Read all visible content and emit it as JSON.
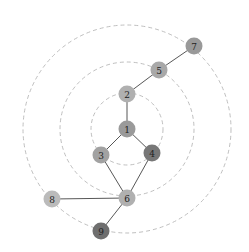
{
  "diagram": {
    "type": "radial-graph",
    "center": {
      "x": 127,
      "y": 129
    },
    "rings": [
      {
        "r": 36
      },
      {
        "r": 67
      },
      {
        "r": 104
      }
    ],
    "node_radius": 8.5,
    "nodes": [
      {
        "id": "1",
        "label": "1",
        "x": 127,
        "y": 129,
        "color": "#9a9a9a"
      },
      {
        "id": "2",
        "label": "2",
        "x": 127,
        "y": 94,
        "color": "#b0b0b0"
      },
      {
        "id": "3",
        "label": "3",
        "x": 101,
        "y": 155,
        "color": "#a2a2a2"
      },
      {
        "id": "4",
        "label": "4",
        "x": 152,
        "y": 153,
        "color": "#777777"
      },
      {
        "id": "5",
        "label": "5",
        "x": 159,
        "y": 70,
        "color": "#a8a8a8"
      },
      {
        "id": "6",
        "label": "6",
        "x": 127,
        "y": 198,
        "color": "#b0b0b0"
      },
      {
        "id": "7",
        "label": "7",
        "x": 194,
        "y": 46,
        "color": "#999999"
      },
      {
        "id": "8",
        "label": "8",
        "x": 52,
        "y": 199,
        "color": "#bbbbbb"
      },
      {
        "id": "9",
        "label": "9",
        "x": 101,
        "y": 231,
        "color": "#6f6f6f"
      }
    ],
    "edges": [
      {
        "from": "7",
        "to": "5"
      },
      {
        "from": "5",
        "to": "2"
      },
      {
        "from": "2",
        "to": "1"
      },
      {
        "from": "1",
        "to": "3"
      },
      {
        "from": "1",
        "to": "4"
      },
      {
        "from": "3",
        "to": "6"
      },
      {
        "from": "4",
        "to": "6"
      },
      {
        "from": "8",
        "to": "6"
      },
      {
        "from": "6",
        "to": "9"
      }
    ]
  }
}
